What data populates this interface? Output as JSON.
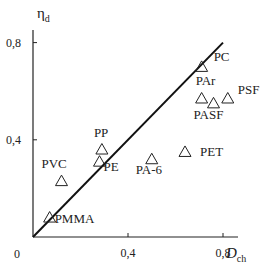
{
  "chart_data": {
    "type": "scatter",
    "title": "",
    "xlabel": "D_ch",
    "xlabel_main": "D",
    "xlabel_sub": "ch",
    "ylabel": "η_d",
    "ylabel_main": "η",
    "ylabel_sub": "d",
    "xlim": [
      0,
      0.85
    ],
    "ylim": [
      0,
      0.85
    ],
    "origin_label": "0",
    "x_ticks": [
      {
        "value": 0.4,
        "label": "0,4"
      },
      {
        "value": 0.8,
        "label": "0,8"
      }
    ],
    "y_ticks": [
      {
        "value": 0.4,
        "label": "0,4"
      },
      {
        "value": 0.8,
        "label": "0,8"
      }
    ],
    "grid": false,
    "marker": "open-triangle",
    "reference_line": {
      "type": "y=x",
      "from": [
        0,
        0
      ],
      "to": [
        0.8,
        0.8
      ]
    },
    "points": [
      {
        "label": "PC",
        "x": 0.71,
        "y": 0.7,
        "lx": 12,
        "ly": -6
      },
      {
        "label": "PAr",
        "x": 0.71,
        "y": 0.57,
        "lx": -6,
        "ly": -13
      },
      {
        "label": "PASF",
        "x": 0.76,
        "y": 0.55,
        "lx": -20,
        "ly": 16
      },
      {
        "label": "PSF",
        "x": 0.82,
        "y": 0.57,
        "lx": 10,
        "ly": -4
      },
      {
        "label": "PA-6",
        "x": 0.5,
        "y": 0.32,
        "lx": -16,
        "ly": 15
      },
      {
        "label": "PET",
        "x": 0.64,
        "y": 0.35,
        "lx": 15,
        "ly": 4
      },
      {
        "label": "PP",
        "x": 0.29,
        "y": 0.36,
        "lx": -8,
        "ly": -13
      },
      {
        "label": "PE",
        "x": 0.28,
        "y": 0.31,
        "lx": 4,
        "ly": 9
      },
      {
        "label": "PVC",
        "x": 0.12,
        "y": 0.23,
        "lx": -20,
        "ly": -13
      },
      {
        "label": "PMMA",
        "x": 0.07,
        "y": 0.08,
        "lx": 5,
        "ly": 5
      }
    ]
  },
  "layout": {
    "x0": 33,
    "y0": 237,
    "x_axis_end": 238,
    "y_axis_top": 30,
    "xscale": 237.5,
    "yscale": 243
  }
}
